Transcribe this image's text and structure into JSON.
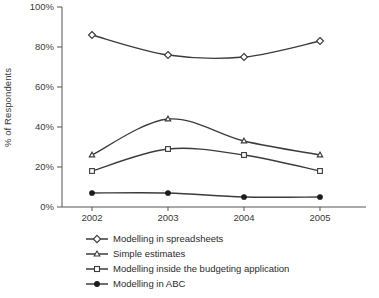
{
  "chart_data": {
    "type": "line",
    "title": "",
    "subtitle": "",
    "xlabel": "",
    "ylabel": "% of Respondents",
    "categories": [
      "2002",
      "2003",
      "2004",
      "2005"
    ],
    "x_tick_labels": [
      "2002",
      "2003",
      "2004",
      "2005"
    ],
    "y_tick_labels": [
      "0%",
      "20%",
      "40%",
      "60%",
      "80%",
      "100%"
    ],
    "y_tick_values": [
      0,
      20,
      40,
      60,
      80,
      100
    ],
    "ylim": [
      0,
      100
    ],
    "grid": false,
    "legend_position": "bottom",
    "series": [
      {
        "name": "Modelling in spreadsheets",
        "marker": "diamond-open",
        "values": [
          86,
          76,
          75,
          83
        ]
      },
      {
        "name": "Simple estimates",
        "marker": "triangle-open",
        "values": [
          26,
          44,
          33,
          26
        ]
      },
      {
        "name": "Modelling inside the budgeting application",
        "marker": "square-open",
        "values": [
          18,
          29,
          26,
          18
        ]
      },
      {
        "name": "Modelling in ABC",
        "marker": "circle-filled",
        "values": [
          7,
          7,
          5,
          5
        ]
      }
    ]
  },
  "colors": {
    "line": "#3b3b3b",
    "axis": "#555555",
    "text": "#2b2b2b",
    "marker_fill_open": "#ffffff",
    "marker_fill_solid": "#1c1c1c",
    "background": "#ffffff"
  },
  "legend": {
    "items": [
      {
        "label": "Modelling in spreadsheets",
        "marker": "diamond-open"
      },
      {
        "label": "Simple estimates",
        "marker": "triangle-open"
      },
      {
        "label": "Modelling inside the budgeting application",
        "marker": "square-open"
      },
      {
        "label": "Modelling in ABC",
        "marker": "circle-filled"
      }
    ]
  }
}
